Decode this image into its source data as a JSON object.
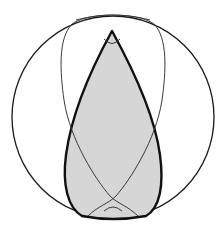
{
  "diagram": {
    "type": "geometric-figure",
    "colors": {
      "background": "#ffffff",
      "outline": "#1a1a1a",
      "thin_line": "#3a3a3a",
      "shade": "#d6d6d6"
    },
    "circle": {
      "cx": 113,
      "cy": 117,
      "r": 101
    },
    "labels": []
  }
}
